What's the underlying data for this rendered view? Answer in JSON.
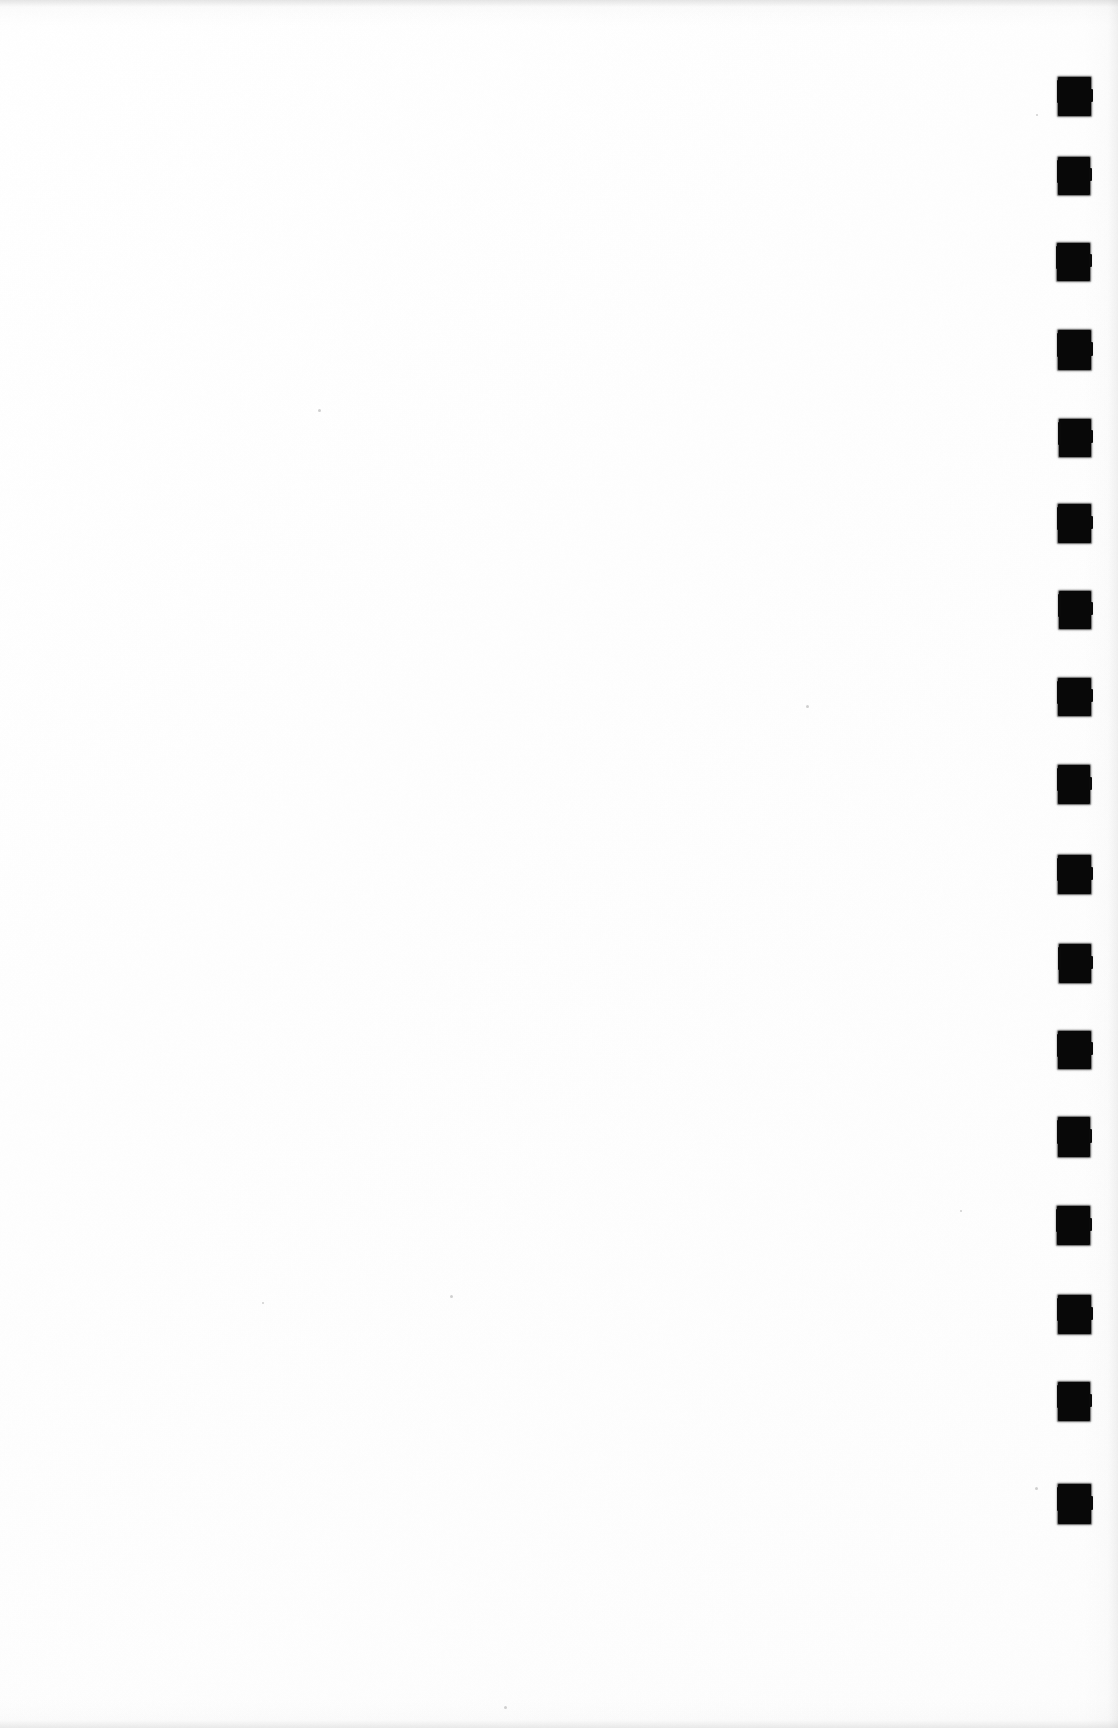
{
  "document": {
    "kind": "scanned-page",
    "title": "Blank scanned page with edge register marks",
    "page_label": "",
    "body_text": "",
    "background_color": "#ffffff",
    "ink_color": "#080808",
    "page_width": 1118,
    "page_height": 1728,
    "content_note": "No printed text or figures are visible on this page."
  },
  "register_marks": {
    "name": "edge-register-mark-column",
    "count": 17,
    "color": "#080808",
    "mark_width": 32,
    "mark_height": 39,
    "column_x": 1058,
    "spacing": 96,
    "items": [
      {
        "index": 1,
        "x": 1058,
        "y": 77,
        "w": 33,
        "h": 39
      },
      {
        "index": 2,
        "x": 1058,
        "y": 157,
        "w": 32,
        "h": 38
      },
      {
        "index": 3,
        "x": 1057,
        "y": 243,
        "w": 33,
        "h": 38
      },
      {
        "index": 4,
        "x": 1058,
        "y": 330,
        "w": 33,
        "h": 40
      },
      {
        "index": 5,
        "x": 1059,
        "y": 419,
        "w": 32,
        "h": 38
      },
      {
        "index": 6,
        "x": 1058,
        "y": 504,
        "w": 33,
        "h": 39
      },
      {
        "index": 7,
        "x": 1059,
        "y": 591,
        "w": 32,
        "h": 38
      },
      {
        "index": 8,
        "x": 1058,
        "y": 678,
        "w": 33,
        "h": 38
      },
      {
        "index": 9,
        "x": 1058,
        "y": 765,
        "w": 32,
        "h": 39
      },
      {
        "index": 10,
        "x": 1058,
        "y": 855,
        "w": 33,
        "h": 39
      },
      {
        "index": 11,
        "x": 1059,
        "y": 944,
        "w": 32,
        "h": 39
      },
      {
        "index": 12,
        "x": 1058,
        "y": 1031,
        "w": 33,
        "h": 38
      },
      {
        "index": 13,
        "x": 1058,
        "y": 1117,
        "w": 32,
        "h": 40
      },
      {
        "index": 14,
        "x": 1057,
        "y": 1206,
        "w": 33,
        "h": 39
      },
      {
        "index": 15,
        "x": 1058,
        "y": 1295,
        "w": 33,
        "h": 39
      },
      {
        "index": 16,
        "x": 1058,
        "y": 1382,
        "w": 32,
        "h": 39
      },
      {
        "index": 17,
        "x": 1058,
        "y": 1484,
        "w": 33,
        "h": 40
      }
    ]
  },
  "specks": [
    {
      "x": 318,
      "y": 409,
      "d": 3
    },
    {
      "x": 806,
      "y": 705,
      "d": 3
    },
    {
      "x": 450,
      "y": 1295,
      "d": 3
    },
    {
      "x": 262,
      "y": 1302,
      "d": 2
    },
    {
      "x": 1035,
      "y": 1487,
      "d": 3
    },
    {
      "x": 1036,
      "y": 114,
      "d": 2
    },
    {
      "x": 504,
      "y": 1706,
      "d": 3
    },
    {
      "x": 960,
      "y": 1210,
      "d": 2
    }
  ]
}
